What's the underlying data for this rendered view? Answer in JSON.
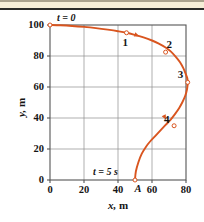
{
  "figure": {
    "name": "trajectory-plot",
    "background_color": "#ffffff",
    "band_color": "#f6eed7",
    "rule_color": "#2b2b28",
    "curve_color": "#d9551f",
    "grid_color": "#8c8c8c",
    "frame_color": "#555555",
    "text_color": "#141414"
  },
  "axes": {
    "x_label": "x,",
    "x_unit": "m",
    "y_label": "y,",
    "y_unit": "m",
    "x_ticks": [
      "0",
      "20",
      "40",
      "60",
      "80"
    ],
    "y_ticks": [
      "0",
      "20",
      "40",
      "60",
      "80",
      "100"
    ],
    "x_min": 0,
    "x_max": 90,
    "y_min": 0,
    "y_max": 105
  },
  "annotations": {
    "start_time": "t = 0",
    "end_time": "t = 5 s",
    "point_a": "A"
  },
  "chart_data": {
    "type": "line",
    "title": "",
    "xlabel": "x, m",
    "ylabel": "y, m",
    "xlim": [
      0,
      90
    ],
    "ylim": [
      0,
      105
    ],
    "grid": true,
    "legend": null,
    "series": [
      {
        "name": "trajectory",
        "color": "#d9551f",
        "x": [
          0,
          6,
          13,
          20,
          27,
          34,
          40,
          45,
          50,
          55,
          60,
          64,
          68,
          71,
          74,
          76.5,
          78.5,
          80,
          80.8,
          81,
          80.6,
          79.6,
          78,
          76,
          73.5,
          71,
          68,
          65,
          62,
          59,
          56.5,
          54,
          52,
          50.5,
          50
        ],
        "y": [
          100,
          99.8,
          99.4,
          98.8,
          98.0,
          97.0,
          96.0,
          95.0,
          93.6,
          92.0,
          90.0,
          88.0,
          85.5,
          83.0,
          79.5,
          76.0,
          72.0,
          68.0,
          65.5,
          62.5,
          58.5,
          54.5,
          50.5,
          46.5,
          42.5,
          39.0,
          35.5,
          32.0,
          28.5,
          25.0,
          21.5,
          17.0,
          11.5,
          5.5,
          0
        ]
      }
    ],
    "points": [
      {
        "label": "t = 0",
        "x": 0,
        "y": 100,
        "marker": "open-circle",
        "label_pos": "above-right"
      },
      {
        "label": "1",
        "x": 45,
        "y": 95,
        "marker": "open-circle",
        "label_pos": "below-left"
      },
      {
        "label": "2",
        "x": 68,
        "y": 82.5,
        "marker": "open-circle",
        "label_pos": "above-right"
      },
      {
        "label": "3",
        "x": 81,
        "y": 63,
        "marker": "open-circle",
        "label_pos": "above-left"
      },
      {
        "label": "4",
        "x": 73,
        "y": 35,
        "marker": "open-circle",
        "label_pos": "above-left"
      },
      {
        "label": "A",
        "x": 50,
        "y": 0,
        "marker": "open-circle",
        "label_pos": "below-right"
      }
    ],
    "direction_arrows": [
      {
        "x": 51,
        "y": 93.4,
        "angle": 20
      },
      {
        "x": 67.5,
        "y": 40.5,
        "angle": 62
      }
    ]
  }
}
